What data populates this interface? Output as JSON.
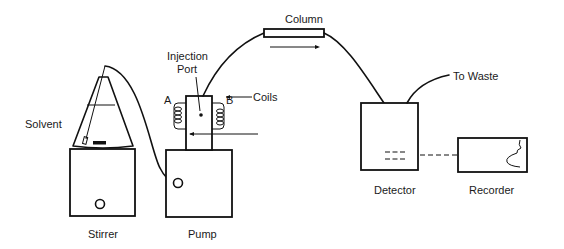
{
  "diagram": {
    "type": "HPLC system schematic",
    "components": [
      {
        "id": "solvent",
        "label": "Solvent"
      },
      {
        "id": "stirrer",
        "label": "Stirrer"
      },
      {
        "id": "pump",
        "label": "Pump"
      },
      {
        "id": "injection_port",
        "label_line1": "Injection",
        "label_line2": "Port"
      },
      {
        "id": "coil_a",
        "label": "A"
      },
      {
        "id": "coil_b",
        "label": "B"
      },
      {
        "id": "coils",
        "label": "Coils"
      },
      {
        "id": "column",
        "label": "Column"
      },
      {
        "id": "waste",
        "label": "To Waste"
      },
      {
        "id": "detector",
        "label": "Detector"
      },
      {
        "id": "recorder",
        "label": "Recorder"
      }
    ],
    "connections": [
      {
        "from": "solvent",
        "to": "pump",
        "style": "solid"
      },
      {
        "from": "injection_port",
        "to": "column",
        "style": "solid"
      },
      {
        "from": "column",
        "to": "detector",
        "style": "solid"
      },
      {
        "from": "detector",
        "to": "waste",
        "style": "solid"
      },
      {
        "from": "detector",
        "to": "recorder",
        "style": "dashed"
      }
    ],
    "colors": {
      "line": "#111111",
      "background": "#ffffff"
    }
  }
}
